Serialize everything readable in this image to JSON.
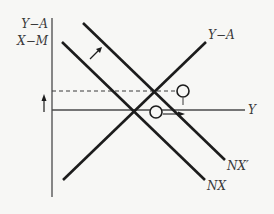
{
  "diagram": {
    "axis_labels": {
      "y_axis_line1": "Y−A",
      "y_axis_line2": "X−M",
      "x_axis": "Y"
    },
    "curve_labels": {
      "saving_investment": "Y−A",
      "net_exports_shifted": "NX′",
      "net_exports": "NX"
    },
    "colors": {
      "line": "#1c1c1c",
      "axis": "#4a4a4a",
      "background": "#f7f7f5"
    }
  }
}
